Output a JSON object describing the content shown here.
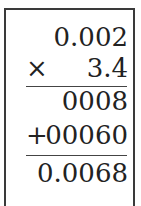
{
  "problem": {
    "multiplicand": "0.002",
    "multiplier_operator": "×",
    "multiplier": "3.4",
    "partial_product_1": "0008",
    "addition_operator": "+",
    "partial_product_2": "00060",
    "result": "0.0068"
  }
}
